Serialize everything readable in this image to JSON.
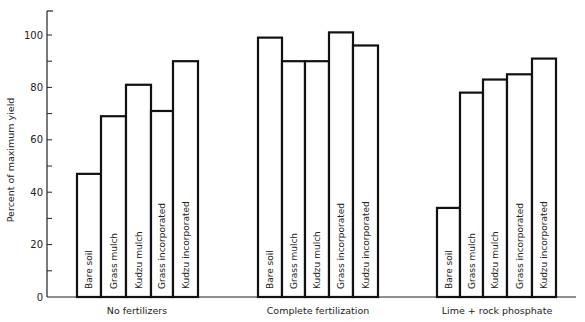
{
  "chart_data": {
    "type": "bar",
    "title": "",
    "xlabel": "",
    "ylabel": "Percent of maximum yield",
    "ylim": [
      0,
      110
    ],
    "yticks": [
      0,
      20,
      40,
      60,
      80,
      100
    ],
    "grid": false,
    "legend": null,
    "groups": [
      {
        "name": "No fertilizers",
        "categories": [
          "Bare soil",
          "Grass mulch",
          "Kudzu mulch",
          "Grass incorporated",
          "Kudzu incorporated"
        ],
        "values": [
          47,
          69,
          81,
          71,
          90
        ]
      },
      {
        "name": "Complete fertilization",
        "categories": [
          "Bare soil",
          "Grass mulch",
          "Kudzu mulch",
          "Grass incorporated",
          "Kudzu incorporated"
        ],
        "values": [
          99,
          90,
          90,
          101,
          96
        ]
      },
      {
        "name": "Lime + rock phosphate",
        "categories": [
          "Bare soil",
          "Grass mulch",
          "Kudzu mulch",
          "Grass incorporated",
          "Kudzu incorporated"
        ],
        "values": [
          34,
          78,
          83,
          85,
          91
        ]
      }
    ]
  },
  "style": {
    "bar_fill": "#ffffff",
    "bar_stroke": "#111111",
    "axis_color": "#222222"
  }
}
